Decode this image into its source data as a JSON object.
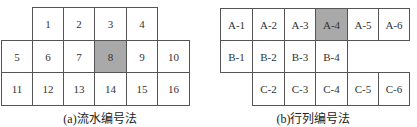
{
  "highlight_color": "#a9a9a9",
  "figure_a": {
    "caption": "(a)流水编号法",
    "cells": [
      {
        "label": "1",
        "x": 32,
        "y": 7,
        "w": 32,
        "h": 34,
        "highlight": false
      },
      {
        "label": "2",
        "x": 63,
        "y": 7,
        "w": 32,
        "h": 34,
        "highlight": false
      },
      {
        "label": "3",
        "x": 94,
        "y": 7,
        "w": 33,
        "h": 34,
        "highlight": false
      },
      {
        "label": "4",
        "x": 126,
        "y": 7,
        "w": 32,
        "h": 34,
        "highlight": false
      },
      {
        "label": "5",
        "x": 1,
        "y": 40,
        "w": 32,
        "h": 33,
        "highlight": false
      },
      {
        "label": "6",
        "x": 32,
        "y": 40,
        "w": 32,
        "h": 33,
        "highlight": false
      },
      {
        "label": "7",
        "x": 63,
        "y": 40,
        "w": 32,
        "h": 33,
        "highlight": false
      },
      {
        "label": "8",
        "x": 94,
        "y": 40,
        "w": 33,
        "h": 33,
        "highlight": true
      },
      {
        "label": "9",
        "x": 126,
        "y": 40,
        "w": 32,
        "h": 33,
        "highlight": false
      },
      {
        "label": "10",
        "x": 157,
        "y": 40,
        "w": 33,
        "h": 33,
        "highlight": false
      },
      {
        "label": "11",
        "x": 1,
        "y": 72,
        "w": 32,
        "h": 34,
        "highlight": false
      },
      {
        "label": "12",
        "x": 32,
        "y": 72,
        "w": 32,
        "h": 34,
        "highlight": false
      },
      {
        "label": "13",
        "x": 63,
        "y": 72,
        "w": 32,
        "h": 34,
        "highlight": false
      },
      {
        "label": "14",
        "x": 94,
        "y": 72,
        "w": 33,
        "h": 34,
        "highlight": false
      },
      {
        "label": "15",
        "x": 126,
        "y": 72,
        "w": 32,
        "h": 34,
        "highlight": false
      },
      {
        "label": "16",
        "x": 157,
        "y": 72,
        "w": 33,
        "h": 34,
        "highlight": false
      }
    ]
  },
  "figure_b": {
    "caption": "(b)行列编号法",
    "cells": [
      {
        "label": "A-1",
        "x": 220,
        "y": 8,
        "w": 33,
        "h": 33,
        "highlight": false
      },
      {
        "label": "A-2",
        "x": 252,
        "y": 8,
        "w": 33,
        "h": 33,
        "highlight": false
      },
      {
        "label": "A-3",
        "x": 284,
        "y": 8,
        "w": 32,
        "h": 33,
        "highlight": false
      },
      {
        "label": "A-4",
        "x": 315,
        "y": 8,
        "w": 33,
        "h": 33,
        "highlight": true
      },
      {
        "label": "A-5",
        "x": 347,
        "y": 8,
        "w": 32,
        "h": 33,
        "highlight": false
      },
      {
        "label": "A-6",
        "x": 378,
        "y": 8,
        "w": 32,
        "h": 33,
        "highlight": false
      },
      {
        "label": "B-1",
        "x": 220,
        "y": 40,
        "w": 33,
        "h": 33,
        "highlight": false
      },
      {
        "label": "B-2",
        "x": 252,
        "y": 40,
        "w": 33,
        "h": 33,
        "highlight": false
      },
      {
        "label": "B-3",
        "x": 284,
        "y": 40,
        "w": 32,
        "h": 33,
        "highlight": false
      },
      {
        "label": "B-4",
        "x": 315,
        "y": 40,
        "w": 33,
        "h": 33,
        "highlight": false
      },
      {
        "label": "C-2",
        "x": 252,
        "y": 72,
        "w": 33,
        "h": 34,
        "highlight": false
      },
      {
        "label": "C-3",
        "x": 284,
        "y": 72,
        "w": 32,
        "h": 34,
        "highlight": false
      },
      {
        "label": "C-4",
        "x": 315,
        "y": 72,
        "w": 33,
        "h": 34,
        "highlight": false
      },
      {
        "label": "C-5",
        "x": 347,
        "y": 72,
        "w": 32,
        "h": 34,
        "highlight": false
      },
      {
        "label": "C-6",
        "x": 378,
        "y": 72,
        "w": 32,
        "h": 34,
        "highlight": false
      }
    ]
  }
}
